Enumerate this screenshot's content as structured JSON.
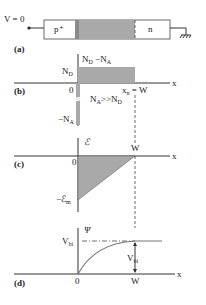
{
  "device": {
    "voltage_label": "V = 0",
    "p_region_label": "p⁺",
    "n_region_label": "n",
    "ground_symbol": "ground-icon"
  },
  "panels": {
    "a": "(a)",
    "b": "(b)",
    "c": "(c)",
    "d": "(d)"
  },
  "panel_b": {
    "y_label_main": "N",
    "y_label_sub_d": "D",
    "y_label_minus": " −N",
    "y_label_sub_a": "A",
    "nd_label": "N",
    "nd_sub": "D",
    "neg_na_label": "−N",
    "neg_na_sub": "A",
    "zero": "0",
    "x_axis": "x",
    "xn_label": "x",
    "xn_sub": "n",
    "xn_eq": " = W",
    "condition_a": "N",
    "condition_a_sub": "A",
    "condition_op": ">>",
    "condition_d": "N",
    "condition_d_sub": "D"
  },
  "panel_c": {
    "y_label": "ℰ",
    "zero": "0",
    "x_axis": "x",
    "w_label": "W",
    "em_label": "−ℰ",
    "em_sub": "m"
  },
  "panel_d": {
    "y_label": "Ψ",
    "vbi_label": "V",
    "vbi_sub": "bi",
    "zero": "0",
    "w_label": "W",
    "x_axis": "x"
  }
}
